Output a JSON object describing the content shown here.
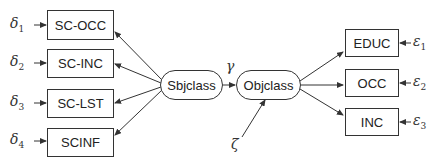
{
  "diagram": {
    "type": "structural-equation-model",
    "indicators_left": [
      {
        "label": "SC-OCC",
        "error": "δ",
        "error_sub": "1"
      },
      {
        "label": "SC-INC",
        "error": "δ",
        "error_sub": "2"
      },
      {
        "label": "SC-LST",
        "error": "δ",
        "error_sub": "3"
      },
      {
        "label": "SCINF",
        "error": "δ",
        "error_sub": "4"
      }
    ],
    "latent_left": {
      "label": "Sbjclass"
    },
    "latent_right": {
      "label": "Objclass"
    },
    "path_coefficient": "γ",
    "disturbance": "ζ",
    "indicators_right": [
      {
        "label": "EDUC",
        "error": "ε",
        "error_sub": "1"
      },
      {
        "label": "OCC",
        "error": "ε",
        "error_sub": "2"
      },
      {
        "label": "INC",
        "error": "ε",
        "error_sub": "3"
      }
    ],
    "colors": {
      "stroke": "#333333",
      "text": "#222222"
    }
  }
}
